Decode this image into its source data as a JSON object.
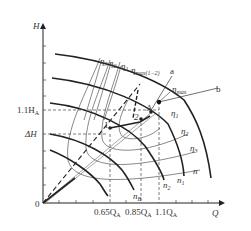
{
  "axes": {
    "y_label": "H",
    "x_label": "Q",
    "origin_label": "0"
  },
  "y_ticks": [
    {
      "label": "1.1H",
      "sub": "A"
    },
    {
      "label": "ΔH",
      "sub": ""
    }
  ],
  "x_ticks": [
    {
      "label": "0.65Q",
      "sub": "A"
    },
    {
      "label": "0.85Q",
      "sub": "A"
    },
    {
      "label": "1.1Q",
      "sub": "A"
    }
  ],
  "speed_curves": {
    "labels": [
      "n",
      "n1",
      "n2",
      "nB"
    ],
    "n": "n",
    "n1": {
      "base": "n",
      "sub": "1"
    },
    "n2": {
      "base": "n",
      "sub": "2"
    },
    "nB": {
      "base": "n",
      "sub": "B"
    }
  },
  "efficiency_labels": {
    "top": [
      {
        "base": "η",
        "sub": "3"
      },
      {
        "base": "η",
        "sub": "2"
      },
      {
        "base": "η",
        "sub": "1"
      },
      {
        "base": "η",
        "sub": "max(1−2)"
      }
    ],
    "right": [
      {
        "base": "η",
        "sub": "1"
      },
      {
        "base": "η",
        "sub": "2"
      },
      {
        "base": "η",
        "sub": "3"
      }
    ],
    "eta_max": {
      "base": "η",
      "sub": "max"
    }
  },
  "lines": {
    "a": "a",
    "b": "b"
  },
  "points": {
    "A": "A",
    "p1": "1",
    "p2": "2"
  },
  "colors": {
    "stroke": "#222222",
    "thin": "#555555",
    "dash": "#444444",
    "background": "#ffffff"
  }
}
